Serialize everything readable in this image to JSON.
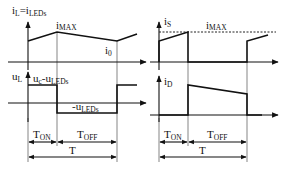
{
  "diagram": {
    "left_panel": {
      "top_plot": {
        "ylabel_main": "i",
        "ylabel_sub": "L",
        "ylabel_eq": "=i",
        "ylabel_eq_sub": "LEDs",
        "peak_label_main": "i",
        "peak_label_sub": "MAX",
        "valley_label_main": "i",
        "valley_label_sub": "0"
      },
      "bottom_plot": {
        "ylabel_main": "u",
        "ylabel_sub": "L",
        "high_label_main": "u",
        "high_label_sub1": "c",
        "high_label_mid": "-u",
        "high_label_sub2": "LEDs",
        "low_label_main": "-u",
        "low_label_sub": "LEDs"
      },
      "timing": {
        "ton_main": "T",
        "ton_sub": "ON",
        "toff_main": "T",
        "toff_sub": "OFF",
        "period": "T"
      }
    },
    "right_panel": {
      "top_plot": {
        "ylabel_main": "i",
        "ylabel_sub": "S",
        "ref_label_main": "i",
        "ref_label_sub": "MAX"
      },
      "bottom_plot": {
        "ylabel_main": "i",
        "ylabel_sub": "D"
      },
      "timing": {
        "ton_main": "T",
        "ton_sub": "ON",
        "toff_main": "T",
        "toff_sub": "OFF",
        "period": "T"
      }
    },
    "colors": {
      "stroke": "#111111",
      "background": "#ffffff"
    }
  }
}
